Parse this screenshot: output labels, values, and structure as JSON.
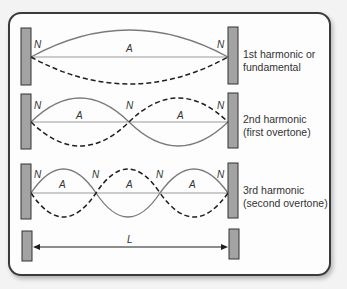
{
  "harmonics": [
    {
      "caption_line1": "1st harmonic or",
      "caption_line2": "fundamental",
      "node_label": "N",
      "antinode_label": "A"
    },
    {
      "caption_line1": "2nd harmonic",
      "caption_line2": "(first overtone)",
      "node_label": "N",
      "antinode_label": "A"
    },
    {
      "caption_line1": "3rd harmonic",
      "caption_line2": "(second overtone)",
      "node_label": "N",
      "antinode_label": "A"
    }
  ],
  "length_label": "L",
  "colors": {
    "bar_fill": "#a3a3a3",
    "bar_stroke": "#333333",
    "solid_wave": "#7a7a7a",
    "dashed_wave": "#1e1e1e",
    "midline": "#9a9a9a"
  }
}
